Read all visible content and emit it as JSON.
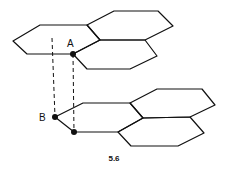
{
  "figure": {
    "caption": "5.6",
    "labels": {
      "a": "A",
      "b": "B"
    },
    "stroke_color": "#111111"
  }
}
